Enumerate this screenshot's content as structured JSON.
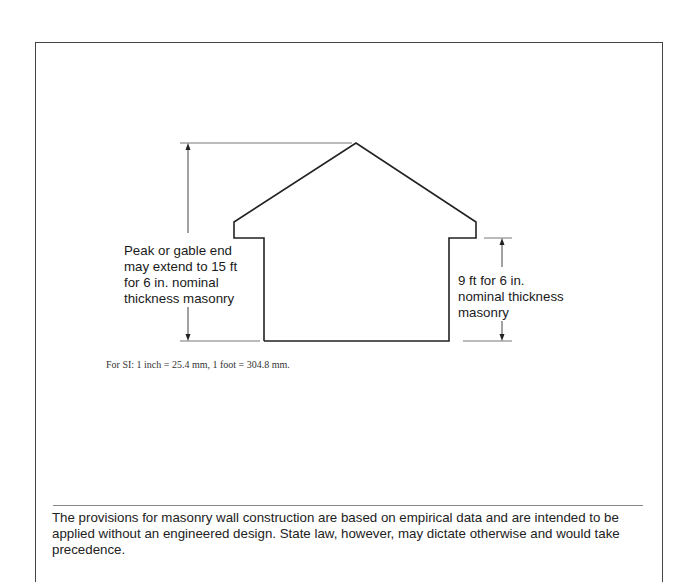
{
  "figure": {
    "left_dimension_label": "Peak or gable end\nmay extend to 15 ft\nfor 6 in. nominal\nthickness masonry",
    "right_dimension_label": "9 ft for 6 in.\nnominal thickness\nmasonry",
    "si_note": "For SI: 1 inch = 25.4 mm, 1 foot = 304.8 mm."
  },
  "footer": {
    "text": "The provisions for masonry wall construction are based on empirical data and are intended to be applied without an engineered design. State law, however, may dictate otherwise and would take precedence."
  }
}
